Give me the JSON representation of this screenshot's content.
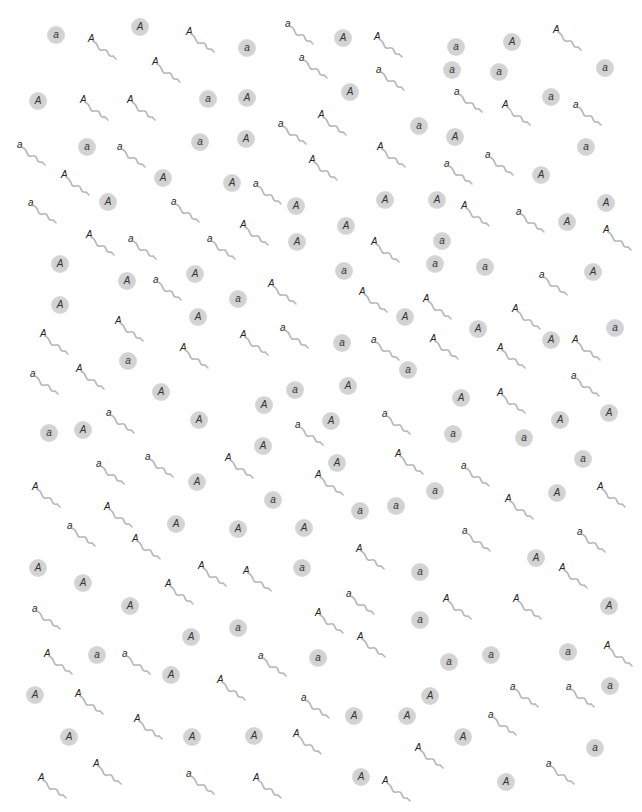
{
  "diagram": {
    "colors": {
      "egg_fill": "#d0d0d0",
      "tail": "#b8b8b8",
      "text": "#333333"
    },
    "eggs": [
      {
        "allele": "a",
        "x": 56,
        "y": 35
      },
      {
        "allele": "A",
        "x": 140,
        "y": 27
      },
      {
        "allele": "a",
        "x": 247,
        "y": 48
      },
      {
        "allele": "A",
        "x": 343,
        "y": 38
      },
      {
        "allele": "a",
        "x": 456,
        "y": 47
      },
      {
        "allele": "A",
        "x": 512,
        "y": 42
      },
      {
        "allele": "a",
        "x": 452,
        "y": 70
      },
      {
        "allele": "a",
        "x": 499,
        "y": 72
      },
      {
        "allele": "a",
        "x": 605,
        "y": 68
      },
      {
        "allele": "A",
        "x": 350,
        "y": 92
      },
      {
        "allele": "A",
        "x": 38,
        "y": 101
      },
      {
        "allele": "a",
        "x": 208,
        "y": 99
      },
      {
        "allele": "A",
        "x": 247,
        "y": 98
      },
      {
        "allele": "a",
        "x": 551,
        "y": 97
      },
      {
        "allele": "a",
        "x": 419,
        "y": 126
      },
      {
        "allele": "A",
        "x": 455,
        "y": 137
      },
      {
        "allele": "a",
        "x": 87,
        "y": 147
      },
      {
        "allele": "a",
        "x": 200,
        "y": 142
      },
      {
        "allele": "A",
        "x": 246,
        "y": 139
      },
      {
        "allele": "a",
        "x": 586,
        "y": 147
      },
      {
        "allele": "A",
        "x": 163,
        "y": 178
      },
      {
        "allele": "A",
        "x": 232,
        "y": 183
      },
      {
        "allele": "A",
        "x": 541,
        "y": 175
      },
      {
        "allele": "A",
        "x": 108,
        "y": 202
      },
      {
        "allele": "A",
        "x": 296,
        "y": 206
      },
      {
        "allele": "A",
        "x": 385,
        "y": 200
      },
      {
        "allele": "A",
        "x": 437,
        "y": 200
      },
      {
        "allele": "A",
        "x": 606,
        "y": 203
      },
      {
        "allele": "A",
        "x": 346,
        "y": 226
      },
      {
        "allele": "A",
        "x": 567,
        "y": 222
      },
      {
        "allele": "A",
        "x": 297,
        "y": 242
      },
      {
        "allele": "a",
        "x": 442,
        "y": 241
      },
      {
        "allele": "A",
        "x": 60,
        "y": 264
      },
      {
        "allele": "a",
        "x": 344,
        "y": 271
      },
      {
        "allele": "a",
        "x": 435,
        "y": 264
      },
      {
        "allele": "a",
        "x": 485,
        "y": 267
      },
      {
        "allele": "A",
        "x": 593,
        "y": 272
      },
      {
        "allele": "A",
        "x": 127,
        "y": 281
      },
      {
        "allele": "A",
        "x": 195,
        "y": 274
      },
      {
        "allele": "a",
        "x": 238,
        "y": 299
      },
      {
        "allele": "A",
        "x": 60,
        "y": 305
      },
      {
        "allele": "A",
        "x": 198,
        "y": 317
      },
      {
        "allele": "A",
        "x": 405,
        "y": 317
      },
      {
        "allele": "A",
        "x": 478,
        "y": 329
      },
      {
        "allele": "a",
        "x": 615,
        "y": 328
      },
      {
        "allele": "A",
        "x": 551,
        "y": 340
      },
      {
        "allele": "a",
        "x": 342,
        "y": 343
      },
      {
        "allele": "a",
        "x": 128,
        "y": 361
      },
      {
        "allele": "a",
        "x": 408,
        "y": 370
      },
      {
        "allele": "A",
        "x": 161,
        "y": 392
      },
      {
        "allele": "a",
        "x": 295,
        "y": 390
      },
      {
        "allele": "A",
        "x": 348,
        "y": 386
      },
      {
        "allele": "A",
        "x": 461,
        "y": 398
      },
      {
        "allele": "A",
        "x": 609,
        "y": 413
      },
      {
        "allele": "A",
        "x": 264,
        "y": 405
      },
      {
        "allele": "A",
        "x": 199,
        "y": 420
      },
      {
        "allele": "A",
        "x": 331,
        "y": 421
      },
      {
        "allele": "A",
        "x": 560,
        "y": 420
      },
      {
        "allele": "a",
        "x": 49,
        "y": 433
      },
      {
        "allele": "A",
        "x": 83,
        "y": 430
      },
      {
        "allele": "a",
        "x": 453,
        "y": 434
      },
      {
        "allele": "a",
        "x": 524,
        "y": 438
      },
      {
        "allele": "A",
        "x": 263,
        "y": 446
      },
      {
        "allele": "A",
        "x": 337,
        "y": 463
      },
      {
        "allele": "a",
        "x": 583,
        "y": 459
      },
      {
        "allele": "A",
        "x": 197,
        "y": 482
      },
      {
        "allele": "a",
        "x": 435,
        "y": 491
      },
      {
        "allele": "A",
        "x": 557,
        "y": 493
      },
      {
        "allele": "a",
        "x": 273,
        "y": 500
      },
      {
        "allele": "a",
        "x": 360,
        "y": 511
      },
      {
        "allele": "a",
        "x": 396,
        "y": 506
      },
      {
        "allele": "A",
        "x": 176,
        "y": 524
      },
      {
        "allele": "A",
        "x": 238,
        "y": 529
      },
      {
        "allele": "A",
        "x": 304,
        "y": 528
      },
      {
        "allele": "A",
        "x": 536,
        "y": 558
      },
      {
        "allele": "A",
        "x": 38,
        "y": 568
      },
      {
        "allele": "a",
        "x": 302,
        "y": 568
      },
      {
        "allele": "A",
        "x": 83,
        "y": 583
      },
      {
        "allele": "a",
        "x": 420,
        "y": 572
      },
      {
        "allele": "A",
        "x": 130,
        "y": 606
      },
      {
        "allele": "A",
        "x": 609,
        "y": 606
      },
      {
        "allele": "a",
        "x": 420,
        "y": 620
      },
      {
        "allele": "a",
        "x": 238,
        "y": 628
      },
      {
        "allele": "A",
        "x": 191,
        "y": 637
      },
      {
        "allele": "a",
        "x": 97,
        "y": 655
      },
      {
        "allele": "a",
        "x": 318,
        "y": 658
      },
      {
        "allele": "a",
        "x": 491,
        "y": 655
      },
      {
        "allele": "a",
        "x": 449,
        "y": 662
      },
      {
        "allele": "a",
        "x": 568,
        "y": 652
      },
      {
        "allele": "A",
        "x": 171,
        "y": 675
      },
      {
        "allele": "a",
        "x": 610,
        "y": 686
      },
      {
        "allele": "A",
        "x": 35,
        "y": 695
      },
      {
        "allele": "A",
        "x": 430,
        "y": 696
      },
      {
        "allele": "A",
        "x": 354,
        "y": 716
      },
      {
        "allele": "A",
        "x": 407,
        "y": 716
      },
      {
        "allele": "A",
        "x": 69,
        "y": 737
      },
      {
        "allele": "A",
        "x": 192,
        "y": 737
      },
      {
        "allele": "A",
        "x": 254,
        "y": 736
      },
      {
        "allele": "A",
        "x": 463,
        "y": 737
      },
      {
        "allele": "a",
        "x": 595,
        "y": 748
      },
      {
        "allele": "A",
        "x": 361,
        "y": 777
      },
      {
        "allele": "A",
        "x": 506,
        "y": 782
      }
    ],
    "sperm": [
      {
        "allele": "A",
        "x": 93,
        "y": 40
      },
      {
        "allele": "A",
        "x": 191,
        "y": 33
      },
      {
        "allele": "a",
        "x": 290,
        "y": 25
      },
      {
        "allele": "A",
        "x": 379,
        "y": 38
      },
      {
        "allele": "A",
        "x": 558,
        "y": 31
      },
      {
        "allele": "A",
        "x": 157,
        "y": 63
      },
      {
        "allele": "a",
        "x": 304,
        "y": 59
      },
      {
        "allele": "a",
        "x": 381,
        "y": 71
      },
      {
        "allele": "A",
        "x": 85,
        "y": 101
      },
      {
        "allele": "A",
        "x": 132,
        "y": 101
      },
      {
        "allele": "a",
        "x": 459,
        "y": 93
      },
      {
        "allele": "A",
        "x": 507,
        "y": 106
      },
      {
        "allele": "a",
        "x": 578,
        "y": 106
      },
      {
        "allele": "a",
        "x": 283,
        "y": 125
      },
      {
        "allele": "A",
        "x": 323,
        "y": 116
      },
      {
        "allele": "a",
        "x": 22,
        "y": 146
      },
      {
        "allele": "a",
        "x": 122,
        "y": 148
      },
      {
        "allele": "A",
        "x": 382,
        "y": 148
      },
      {
        "allele": "a",
        "x": 449,
        "y": 165
      },
      {
        "allele": "a",
        "x": 490,
        "y": 156
      },
      {
        "allele": "A",
        "x": 66,
        "y": 176
      },
      {
        "allele": "A",
        "x": 314,
        "y": 161
      },
      {
        "allele": "a",
        "x": 258,
        "y": 185
      },
      {
        "allele": "a",
        "x": 33,
        "y": 204
      },
      {
        "allele": "a",
        "x": 176,
        "y": 203
      },
      {
        "allele": "A",
        "x": 466,
        "y": 207
      },
      {
        "allele": "a",
        "x": 521,
        "y": 213
      },
      {
        "allele": "A",
        "x": 245,
        "y": 226
      },
      {
        "allele": "A",
        "x": 91,
        "y": 236
      },
      {
        "allele": "a",
        "x": 133,
        "y": 240
      },
      {
        "allele": "a",
        "x": 212,
        "y": 240
      },
      {
        "allele": "A",
        "x": 376,
        "y": 243
      },
      {
        "allele": "A",
        "x": 608,
        "y": 231
      },
      {
        "allele": "a",
        "x": 158,
        "y": 281
      },
      {
        "allele": "A",
        "x": 273,
        "y": 285
      },
      {
        "allele": "a",
        "x": 544,
        "y": 276
      },
      {
        "allele": "A",
        "x": 364,
        "y": 293
      },
      {
        "allele": "A",
        "x": 428,
        "y": 300
      },
      {
        "allele": "A",
        "x": 517,
        "y": 310
      },
      {
        "allele": "A",
        "x": 120,
        "y": 322
      },
      {
        "allele": "A",
        "x": 45,
        "y": 335
      },
      {
        "allele": "A",
        "x": 245,
        "y": 336
      },
      {
        "allele": "a",
        "x": 285,
        "y": 329
      },
      {
        "allele": "a",
        "x": 376,
        "y": 341
      },
      {
        "allele": "A",
        "x": 435,
        "y": 340
      },
      {
        "allele": "A",
        "x": 577,
        "y": 341
      },
      {
        "allele": "A",
        "x": 185,
        "y": 349
      },
      {
        "allele": "A",
        "x": 502,
        "y": 349
      },
      {
        "allele": "a",
        "x": 35,
        "y": 375
      },
      {
        "allele": "A",
        "x": 81,
        "y": 370
      },
      {
        "allele": "a",
        "x": 576,
        "y": 377
      },
      {
        "allele": "A",
        "x": 502,
        "y": 394
      },
      {
        "allele": "a",
        "x": 111,
        "y": 414
      },
      {
        "allele": "a",
        "x": 387,
        "y": 415
      },
      {
        "allele": "a",
        "x": 300,
        "y": 426
      },
      {
        "allele": "A",
        "x": 400,
        "y": 455
      },
      {
        "allele": "a",
        "x": 101,
        "y": 465
      },
      {
        "allele": "a",
        "x": 150,
        "y": 458
      },
      {
        "allele": "A",
        "x": 230,
        "y": 459
      },
      {
        "allele": "a",
        "x": 466,
        "y": 467
      },
      {
        "allele": "A",
        "x": 320,
        "y": 476
      },
      {
        "allele": "A",
        "x": 37,
        "y": 488
      },
      {
        "allele": "A",
        "x": 109,
        "y": 508
      },
      {
        "allele": "A",
        "x": 510,
        "y": 500
      },
      {
        "allele": "A",
        "x": 602,
        "y": 488
      },
      {
        "allele": "a",
        "x": 72,
        "y": 527
      },
      {
        "allele": "a",
        "x": 467,
        "y": 532
      },
      {
        "allele": "A",
        "x": 137,
        "y": 540
      },
      {
        "allele": "a",
        "x": 582,
        "y": 533
      },
      {
        "allele": "A",
        "x": 361,
        "y": 550
      },
      {
        "allele": "A",
        "x": 203,
        "y": 567
      },
      {
        "allele": "A",
        "x": 248,
        "y": 572
      },
      {
        "allele": "A",
        "x": 564,
        "y": 569
      },
      {
        "allele": "A",
        "x": 170,
        "y": 585
      },
      {
        "allele": "a",
        "x": 351,
        "y": 595
      },
      {
        "allele": "A",
        "x": 448,
        "y": 600
      },
      {
        "allele": "a",
        "x": 37,
        "y": 610
      },
      {
        "allele": "A",
        "x": 518,
        "y": 600
      },
      {
        "allele": "A",
        "x": 320,
        "y": 614
      },
      {
        "allele": "A",
        "x": 362,
        "y": 638
      },
      {
        "allele": "A",
        "x": 49,
        "y": 655
      },
      {
        "allele": "a",
        "x": 127,
        "y": 655
      },
      {
        "allele": "a",
        "x": 263,
        "y": 657
      },
      {
        "allele": "A",
        "x": 609,
        "y": 647
      },
      {
        "allele": "A",
        "x": 222,
        "y": 681
      },
      {
        "allele": "A",
        "x": 80,
        "y": 695
      },
      {
        "allele": "a",
        "x": 306,
        "y": 699
      },
      {
        "allele": "a",
        "x": 515,
        "y": 688
      },
      {
        "allele": "a",
        "x": 571,
        "y": 688
      },
      {
        "allele": "a",
        "x": 493,
        "y": 716
      },
      {
        "allele": "A",
        "x": 139,
        "y": 720
      },
      {
        "allele": "A",
        "x": 298,
        "y": 735
      },
      {
        "allele": "A",
        "x": 420,
        "y": 749
      },
      {
        "allele": "A",
        "x": 43,
        "y": 779
      },
      {
        "allele": "A",
        "x": 98,
        "y": 765
      },
      {
        "allele": "a",
        "x": 191,
        "y": 775
      },
      {
        "allele": "A",
        "x": 258,
        "y": 779
      },
      {
        "allele": "A",
        "x": 387,
        "y": 782
      },
      {
        "allele": "a",
        "x": 551,
        "y": 765
      }
    ]
  }
}
